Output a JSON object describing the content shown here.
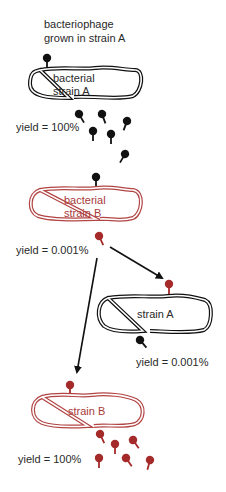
{
  "colors": {
    "black": "#111111",
    "red": "#a52a2a",
    "red_cell": "#b24444",
    "text": "#2a2a2a"
  },
  "title": {
    "line1": "bacteriophage",
    "line2": "grown in strain A"
  },
  "stages": [
    {
      "id": "cell-1",
      "label_line1": "bacterial",
      "label_line2": "strain A",
      "cell_color": "black",
      "infecting_phage": "black",
      "yield": "yield = 100%",
      "progeny_color": "black",
      "progeny_count": 6
    },
    {
      "id": "cell-2",
      "label_line1": "bacterial",
      "label_line2": "strain B",
      "cell_color": "red",
      "infecting_phage": "black",
      "yield": "yield = 0.001%",
      "progeny_color": "red",
      "progeny_count": 1
    },
    {
      "id": "cell-3",
      "label_line1": "strain A",
      "cell_color": "black",
      "infecting_phage": "red",
      "yield": "yield = 0.001%",
      "progeny_color": "black",
      "progeny_count": 1
    },
    {
      "id": "cell-4",
      "label_line1": "strain B",
      "cell_color": "red",
      "infecting_phage": "red",
      "yield": "yield = 100%",
      "progeny_color": "red",
      "progeny_count": 6
    }
  ],
  "arrows": [
    {
      "from": "cell-2",
      "to": "cell-3"
    },
    {
      "from": "cell-2",
      "to": "cell-4"
    }
  ]
}
